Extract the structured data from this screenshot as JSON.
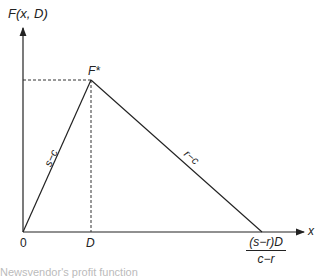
{
  "diagram": {
    "y_axis_label": "F(x, D)",
    "x_axis_label": "x",
    "origin_label": "0",
    "peak_label": "F*",
    "d_label": "D",
    "end_label_numerator": "(s−r)D",
    "end_label_denominator": "c−r",
    "rising_slope_label": "s−c",
    "falling_slope_label": "r−c",
    "caption": "Newsvendor's profit function"
  },
  "geometry": {
    "origin": [
      23,
      232
    ],
    "peak": [
      91,
      80
    ],
    "end": [
      262,
      232
    ],
    "x_axis_end": [
      300,
      232
    ],
    "y_axis_top": [
      23,
      26
    ]
  },
  "colors": {
    "line": "#222222",
    "dashed": "#333333",
    "background": "#ffffff"
  }
}
